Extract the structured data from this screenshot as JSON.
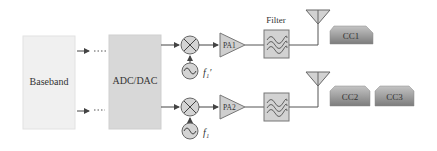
{
  "diagram": {
    "type": "rf-transmitter-block-diagram",
    "blocks": {
      "baseband": {
        "label": "Baseband",
        "fill": "#f0f0f0",
        "stroke": "#e2e2e2"
      },
      "adc_dac": {
        "label": "ADC/DAC",
        "fill": "#d8d8d8",
        "stroke": "#cfcfcf"
      },
      "filter_label": "Filter"
    },
    "chains": [
      {
        "mixer": "mixer",
        "lo_label": "f₁′",
        "pa_label": "PA1",
        "antenna": "antenna",
        "carriers": [
          "CC1"
        ]
      },
      {
        "mixer": "mixer",
        "lo_label": "f₁",
        "pa_label": "PA2",
        "antenna": "antenna",
        "carriers": [
          "CC2",
          "CC3"
        ]
      }
    ],
    "colors": {
      "line": "#555555",
      "component_fill": "#cfcfcf",
      "component_stroke": "#777777",
      "carrier_top": "#bdbdbd",
      "carrier_bottom": "#7a7a7a"
    }
  }
}
